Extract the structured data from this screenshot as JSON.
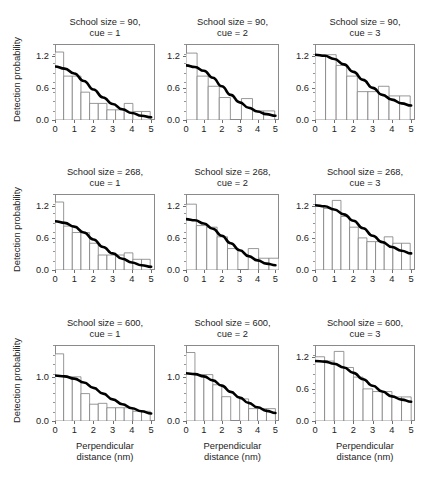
{
  "figure": {
    "shared_ylabel": "Detection probability",
    "shared_xlabel_line1": "Perpendicular",
    "shared_xlabel_line2": "distance (nm)",
    "bar_edge_color": "#7d7d7d",
    "bar_fill_color": "#ffffff",
    "curve_color": "#000000",
    "frame_color": "#8a8a8a"
  },
  "chart_data": [
    {
      "type": "bar",
      "panel_index": 0,
      "row": 0,
      "col": 0,
      "title_line1": "School size = 90,",
      "title_line2": "cue = 1",
      "school_size": 90,
      "cue": 1,
      "xlabel": "Perpendicular distance (nm)",
      "ylabel": "Detection probability",
      "xlim": [
        0,
        5.2
      ],
      "ylim": [
        0,
        1.42
      ],
      "xticks": [
        0,
        1,
        2,
        3,
        4,
        5
      ],
      "xticklabels": [
        "0",
        "1",
        "2",
        "3",
        "4",
        "5"
      ],
      "yticks": [
        0.0,
        0.6,
        1.2
      ],
      "yticklabels": [
        "0.0",
        "0.6",
        "1.2"
      ],
      "grid": false,
      "bin_width": 0.45,
      "bin_starts": [
        0.0,
        0.45,
        0.9,
        1.35,
        1.8,
        2.25,
        2.7,
        3.15,
        3.6,
        4.05,
        4.5
      ],
      "values": [
        1.27,
        0.82,
        0.82,
        0.52,
        0.31,
        0.31,
        0.19,
        0.19,
        0.31,
        0.16,
        0.16
      ],
      "curve": {
        "name": "fitted detection function",
        "x": [
          0.0,
          0.5,
          1.0,
          1.5,
          2.0,
          2.5,
          3.0,
          3.5,
          4.0,
          4.5,
          5.0
        ],
        "y": [
          1.0,
          0.96,
          0.87,
          0.73,
          0.57,
          0.42,
          0.3,
          0.2,
          0.13,
          0.08,
          0.05
        ]
      }
    },
    {
      "type": "bar",
      "panel_index": 1,
      "row": 0,
      "col": 1,
      "title_line1": "School size = 90,",
      "title_line2": "cue = 2",
      "school_size": 90,
      "cue": 2,
      "xlabel": "Perpendicular distance (nm)",
      "ylabel": "Detection probability",
      "xlim": [
        0,
        5.2
      ],
      "ylim": [
        0,
        1.42
      ],
      "xticks": [
        0,
        1,
        2,
        3,
        4,
        5
      ],
      "xticklabels": [
        "0",
        "1",
        "2",
        "3",
        "4",
        "5"
      ],
      "yticks": [
        0.0,
        0.6,
        1.2
      ],
      "yticklabels": [
        "0.0",
        "0.6",
        "1.2"
      ],
      "grid": false,
      "bin_width": 0.62,
      "bin_starts": [
        0.0,
        0.62,
        1.24,
        1.86,
        2.48,
        3.1,
        3.72,
        4.34
      ],
      "values": [
        1.25,
        0.82,
        0.63,
        0.42,
        0.0,
        0.4,
        0.17,
        0.17
      ],
      "curve": {
        "name": "fitted detection function",
        "x": [
          0.0,
          0.5,
          1.0,
          1.5,
          2.0,
          2.5,
          3.0,
          3.5,
          4.0,
          4.5,
          5.0
        ],
        "y": [
          1.02,
          0.99,
          0.92,
          0.79,
          0.63,
          0.47,
          0.33,
          0.23,
          0.16,
          0.11,
          0.08
        ]
      }
    },
    {
      "type": "bar",
      "panel_index": 2,
      "row": 0,
      "col": 2,
      "title_line1": "School size = 90,",
      "title_line2": "cue = 3",
      "school_size": 90,
      "cue": 3,
      "xlabel": "Perpendicular distance (nm)",
      "ylabel": "Detection probability",
      "xlim": [
        0,
        5.2
      ],
      "ylim": [
        0,
        1.42
      ],
      "xticks": [
        0,
        1,
        2,
        3,
        4,
        5
      ],
      "xticklabels": [
        "0",
        "1",
        "2",
        "3",
        "4",
        "5"
      ],
      "yticks": [
        0.0,
        0.6,
        1.2
      ],
      "yticklabels": [
        "0.0",
        "0.6",
        "1.2"
      ],
      "grid": false,
      "bin_width": 0.55,
      "bin_starts": [
        0.0,
        0.55,
        1.1,
        1.65,
        2.2,
        2.75,
        3.3,
        3.85,
        4.4
      ],
      "values": [
        1.22,
        1.22,
        1.02,
        0.82,
        0.53,
        0.53,
        0.63,
        0.45,
        0.45
      ],
      "curve": {
        "name": "fitted detection function",
        "x": [
          0.0,
          0.5,
          1.0,
          1.5,
          2.0,
          2.5,
          3.0,
          3.5,
          4.0,
          4.5,
          5.0
        ],
        "y": [
          1.22,
          1.2,
          1.14,
          1.04,
          0.9,
          0.75,
          0.6,
          0.47,
          0.38,
          0.31,
          0.27
        ]
      }
    },
    {
      "type": "bar",
      "panel_index": 3,
      "row": 1,
      "col": 0,
      "title_line1": "School size = 268,",
      "title_line2": "cue = 1",
      "school_size": 268,
      "cue": 1,
      "xlabel": "Perpendicular distance (nm)",
      "ylabel": "Detection probability",
      "xlim": [
        0,
        5.2
      ],
      "ylim": [
        0,
        1.42
      ],
      "xticks": [
        0,
        1,
        2,
        3,
        4,
        5
      ],
      "xticklabels": [
        "0",
        "1",
        "2",
        "3",
        "4",
        "5"
      ],
      "yticks": [
        0.0,
        0.6,
        1.2
      ],
      "yticklabels": [
        "0.0",
        "0.6",
        "1.2"
      ],
      "grid": false,
      "bin_width": 0.45,
      "bin_starts": [
        0.0,
        0.45,
        0.9,
        1.35,
        1.8,
        2.25,
        2.7,
        3.15,
        3.6,
        4.05,
        4.5
      ],
      "values": [
        1.27,
        0.82,
        0.7,
        0.7,
        0.5,
        0.28,
        0.28,
        0.28,
        0.32,
        0.2,
        0.2
      ],
      "curve": {
        "name": "fitted detection function",
        "x": [
          0.0,
          0.5,
          1.0,
          1.5,
          2.0,
          2.5,
          3.0,
          3.5,
          4.0,
          4.5,
          5.0
        ],
        "y": [
          0.91,
          0.88,
          0.81,
          0.7,
          0.57,
          0.43,
          0.31,
          0.21,
          0.14,
          0.09,
          0.06
        ]
      }
    },
    {
      "type": "bar",
      "panel_index": 4,
      "row": 1,
      "col": 1,
      "title_line1": "School size = 268,",
      "title_line2": "cue = 2",
      "school_size": 268,
      "cue": 2,
      "xlabel": "Perpendicular distance (nm)",
      "ylabel": "Detection probability",
      "xlim": [
        0,
        5.2
      ],
      "ylim": [
        0,
        1.42
      ],
      "xticks": [
        0,
        1,
        2,
        3,
        4,
        5
      ],
      "xticklabels": [
        "0",
        "1",
        "2",
        "3",
        "4",
        "5"
      ],
      "yticks": [
        0.0,
        0.6,
        1.2
      ],
      "yticklabels": [
        "0.0",
        "0.6",
        "1.2"
      ],
      "grid": false,
      "bin_width": 0.58,
      "bin_starts": [
        0.0,
        0.58,
        1.16,
        1.74,
        2.32,
        2.9,
        3.48,
        4.06,
        4.64
      ],
      "values": [
        1.23,
        0.83,
        0.8,
        0.62,
        0.4,
        0.0,
        0.4,
        0.22,
        0.22
      ],
      "curve": {
        "name": "fitted detection function",
        "x": [
          0.0,
          0.5,
          1.0,
          1.5,
          2.0,
          2.5,
          3.0,
          3.5,
          4.0,
          4.5,
          5.0
        ],
        "y": [
          0.95,
          0.93,
          0.87,
          0.77,
          0.64,
          0.5,
          0.37,
          0.26,
          0.18,
          0.12,
          0.09
        ]
      }
    },
    {
      "type": "bar",
      "panel_index": 5,
      "row": 1,
      "col": 2,
      "title_line1": "School size = 268,",
      "title_line2": "cue = 3",
      "school_size": 268,
      "cue": 3,
      "xlabel": "Perpendicular distance (nm)",
      "ylabel": "Detection probability",
      "xlim": [
        0,
        5.2
      ],
      "ylim": [
        0,
        1.42
      ],
      "xticks": [
        0,
        1,
        2,
        3,
        4,
        5
      ],
      "xticklabels": [
        "0",
        "1",
        "2",
        "3",
        "4",
        "5"
      ],
      "yticks": [
        0.0,
        0.6,
        1.2
      ],
      "yticklabels": [
        "0.0",
        "0.6",
        "1.2"
      ],
      "grid": false,
      "bin_width": 0.45,
      "bin_starts": [
        0.0,
        0.45,
        0.9,
        1.35,
        1.8,
        2.25,
        2.7,
        3.15,
        3.6,
        4.05,
        4.5
      ],
      "values": [
        1.2,
        1.15,
        1.3,
        1.0,
        0.8,
        0.6,
        0.53,
        0.53,
        0.62,
        0.5,
        0.5
      ],
      "curve": {
        "name": "fitted detection function",
        "x": [
          0.0,
          0.5,
          1.0,
          1.5,
          2.0,
          2.5,
          3.0,
          3.5,
          4.0,
          4.5,
          5.0
        ],
        "y": [
          1.21,
          1.19,
          1.13,
          1.04,
          0.92,
          0.78,
          0.64,
          0.52,
          0.43,
          0.36,
          0.31
        ]
      }
    },
    {
      "type": "bar",
      "panel_index": 6,
      "row": 2,
      "col": 0,
      "title_line1": "School size = 600,",
      "title_line2": "cue = 1",
      "school_size": 600,
      "cue": 1,
      "xlabel": "Perpendicular distance (nm)",
      "ylabel": "Detection probability",
      "xlim": [
        0,
        5.2
      ],
      "ylim": [
        0,
        1.72
      ],
      "xticks": [
        0,
        1,
        2,
        3,
        4,
        5
      ],
      "xticklabels": [
        "0",
        "1",
        "2",
        "3",
        "4",
        "5"
      ],
      "yticks": [
        0.0,
        1.0
      ],
      "yticklabels": [
        "0.0",
        "1.0"
      ],
      "grid": false,
      "bin_width": 0.45,
      "bin_starts": [
        0.0,
        0.45,
        0.9,
        1.35,
        1.8,
        2.25,
        2.7,
        3.15,
        3.6,
        4.05,
        4.5
      ],
      "values": [
        1.52,
        1.0,
        1.0,
        0.62,
        0.38,
        0.4,
        0.3,
        0.3,
        0.3,
        0.22,
        0.22
      ],
      "curve": {
        "name": "fitted detection function",
        "x": [
          0.0,
          0.5,
          1.0,
          1.5,
          2.0,
          2.5,
          3.0,
          3.5,
          4.0,
          4.5,
          5.0
        ],
        "y": [
          1.03,
          1.01,
          0.96,
          0.87,
          0.75,
          0.62,
          0.49,
          0.38,
          0.29,
          0.22,
          0.17
        ]
      }
    },
    {
      "type": "bar",
      "panel_index": 7,
      "row": 2,
      "col": 1,
      "title_line1": "School size = 600,",
      "title_line2": "cue = 2",
      "school_size": 600,
      "cue": 2,
      "xlabel": "Perpendicular distance (nm)",
      "ylabel": "Detection probability",
      "xlim": [
        0,
        5.2
      ],
      "ylim": [
        0,
        1.72
      ],
      "xticks": [
        0,
        1,
        2,
        3,
        4,
        5
      ],
      "xticklabels": [
        "0",
        "1",
        "2",
        "3",
        "4",
        "5"
      ],
      "yticks": [
        0.0,
        1.0
      ],
      "yticklabels": [
        "0.0",
        "1.0"
      ],
      "grid": false,
      "bin_width": 0.5,
      "bin_starts": [
        0.0,
        0.5,
        1.0,
        1.5,
        2.0,
        2.5,
        3.0,
        3.5,
        4.0,
        4.5
      ],
      "values": [
        1.55,
        1.05,
        1.05,
        0.82,
        0.55,
        0.0,
        0.5,
        0.28,
        0.28,
        0.28
      ],
      "curve": {
        "name": "fitted detection function",
        "x": [
          0.0,
          0.5,
          1.0,
          1.5,
          2.0,
          2.5,
          3.0,
          3.5,
          4.0,
          4.5,
          5.0
        ],
        "y": [
          1.08,
          1.06,
          1.01,
          0.92,
          0.8,
          0.66,
          0.53,
          0.41,
          0.31,
          0.23,
          0.18
        ]
      }
    },
    {
      "type": "bar",
      "panel_index": 8,
      "row": 2,
      "col": 2,
      "title_line1": "School size = 600,",
      "title_line2": "cue = 3",
      "school_size": 600,
      "cue": 3,
      "xlabel": "Perpendicular distance (nm)",
      "ylabel": "Detection probability",
      "xlim": [
        0,
        5.2
      ],
      "ylim": [
        0,
        1.42
      ],
      "xticks": [
        0,
        1,
        2,
        3,
        4,
        5
      ],
      "xticklabels": [
        "0",
        "1",
        "2",
        "3",
        "4",
        "5"
      ],
      "yticks": [
        0.0,
        0.6,
        1.2
      ],
      "yticklabels": [
        "0.0",
        "0.6",
        "1.2"
      ],
      "grid": false,
      "bin_width": 0.5,
      "bin_starts": [
        0.0,
        0.5,
        1.0,
        1.5,
        2.0,
        2.5,
        3.0,
        3.5,
        4.0,
        4.5
      ],
      "values": [
        1.2,
        1.12,
        1.3,
        1.0,
        0.82,
        0.6,
        0.55,
        0.55,
        0.45,
        0.45
      ],
      "curve": {
        "name": "fitted detection function",
        "x": [
          0.0,
          0.5,
          1.0,
          1.5,
          2.0,
          2.5,
          3.0,
          3.5,
          4.0,
          4.5,
          5.0
        ],
        "y": [
          1.12,
          1.11,
          1.07,
          1.0,
          0.9,
          0.78,
          0.66,
          0.55,
          0.46,
          0.4,
          0.36
        ]
      }
    }
  ]
}
